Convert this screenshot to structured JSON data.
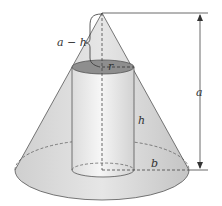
{
  "diagram": {
    "labels": {
      "a_minus_h": "a − h",
      "r": "r",
      "h": "h",
      "b": "b",
      "a": "a"
    },
    "colors": {
      "cone_fill": "#d8d8d8",
      "cone_base": "#c9c9c9",
      "cylinder_fill": "#ececec",
      "cylinder_top": "#8e8e8e",
      "stroke": "#555555"
    }
  }
}
